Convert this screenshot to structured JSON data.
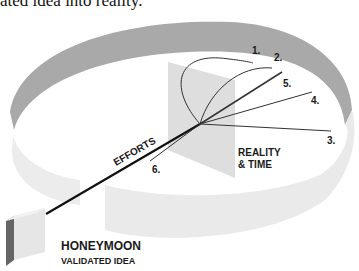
{
  "caption": "ated idea into reality.",
  "labels": {
    "efforts": "EFFORTS",
    "reality_line1": "REALITY",
    "reality_line2": "& TIME",
    "honeymoon": "HONEYMOON",
    "validated": "VALIDATED IDEA"
  },
  "paths": [
    {
      "id": "1",
      "label": "1."
    },
    {
      "id": "2",
      "label": "2."
    },
    {
      "id": "3",
      "label": "3."
    },
    {
      "id": "4",
      "label": "4."
    },
    {
      "id": "5",
      "label": "5."
    },
    {
      "id": "6",
      "label": "6."
    }
  ],
  "colors": {
    "ring_outer": "#a9a9a9",
    "ring_inner": "#e9e9e9",
    "plane": "#dcdcdc",
    "box_front": "#e6e6e6",
    "box_side": "#666666",
    "line": "#111111"
  }
}
